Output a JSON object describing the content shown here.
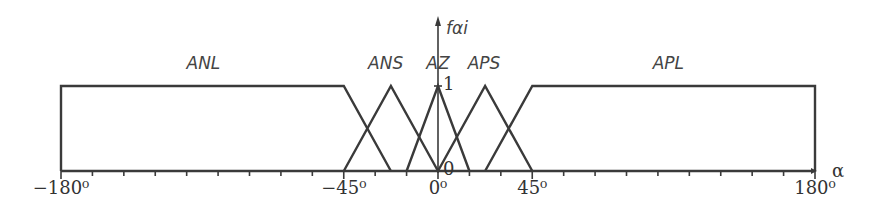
{
  "chart_data": {
    "type": "line",
    "title": "",
    "xlabel": "α",
    "ylabel": "fαi",
    "xlim": [
      -180,
      180
    ],
    "ylim": [
      0,
      1
    ],
    "x_tick_step": 15,
    "x_tick_labels": [
      {
        "value": -180,
        "label": "−180⁰"
      },
      {
        "value": -45,
        "label": "−45⁰"
      },
      {
        "value": 0,
        "label": "0⁰"
      },
      {
        "value": 45,
        "label": "45⁰"
      },
      {
        "value": 180,
        "label": "180⁰"
      }
    ],
    "y_tick_labels": [
      {
        "value": 1,
        "label": "1"
      },
      {
        "value": 0,
        "label": "0"
      }
    ],
    "grid": false,
    "series": [
      {
        "name": "ANL",
        "shape": "trapezoid",
        "points": [
          [
            -180,
            0
          ],
          [
            -180,
            1
          ],
          [
            -45,
            1
          ],
          [
            -22.5,
            0
          ]
        ],
        "label_x": -112
      },
      {
        "name": "ANS",
        "shape": "triangle",
        "points": [
          [
            -45,
            0
          ],
          [
            -22.5,
            1
          ],
          [
            0,
            0
          ]
        ],
        "label_x": -25
      },
      {
        "name": "AZ",
        "shape": "triangle",
        "points": [
          [
            -15,
            0
          ],
          [
            0,
            1
          ],
          [
            15,
            0
          ]
        ],
        "label_x": 0
      },
      {
        "name": "APS",
        "shape": "triangle",
        "points": [
          [
            0,
            0
          ],
          [
            22.5,
            1
          ],
          [
            45,
            0
          ]
        ],
        "label_x": 22
      },
      {
        "name": "APL",
        "shape": "trapezoid",
        "points": [
          [
            22.5,
            0
          ],
          [
            45,
            1
          ],
          [
            180,
            1
          ],
          [
            180,
            0
          ]
        ],
        "label_x": 110
      }
    ]
  }
}
